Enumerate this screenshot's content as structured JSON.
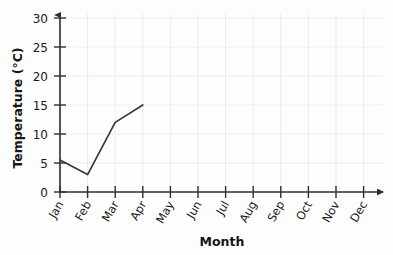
{
  "chart_data": {
    "type": "line",
    "title": "",
    "xlabel": "Month",
    "ylabel": "Temperature (°C)",
    "categories": [
      "Jan",
      "Feb",
      "Mar",
      "Apr",
      "May",
      "Jun",
      "Jul",
      "Aug",
      "Sep",
      "Oct",
      "Nov",
      "Dec"
    ],
    "series": [
      {
        "name": "Temperature",
        "values": [
          5.5,
          3,
          12,
          15,
          null,
          null,
          null,
          null,
          null,
          null,
          null,
          null
        ]
      }
    ],
    "points": [
      {
        "x": "Jan",
        "y": 5.5
      },
      {
        "x": "Feb",
        "y": 3
      },
      {
        "x": "Mar",
        "y": 12
      },
      {
        "x": "Apr",
        "y": 15
      }
    ],
    "yticks": [
      0,
      5,
      10,
      15,
      20,
      25,
      30
    ],
    "ylim": [
      0,
      30
    ],
    "xlim": [
      "Jan",
      "Dec"
    ],
    "grid": true,
    "legend": null,
    "legend_position": "none",
    "markers": false,
    "line_color": "#3a3a3a",
    "grid_color": "#ececec",
    "axis_color": "#2e2e2e",
    "background_color": "#fdfdfd",
    "axis_arrows": {
      "x": true,
      "y": true
    }
  }
}
